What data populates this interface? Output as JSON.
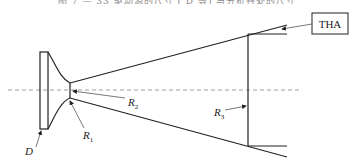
{
  "caption": "图 7 — 33 驱动源的尺寸 ( D 等) 与分析各处的尺寸",
  "labels": {
    "tha": "THA",
    "d": "D",
    "r1": "R",
    "r1_sub": "1",
    "r2": "R",
    "r2_sub": "2",
    "r3": "R",
    "r3_sub": "3"
  },
  "colors": {
    "stroke": "#222222",
    "leader": "#555555",
    "axis": "#888888"
  }
}
